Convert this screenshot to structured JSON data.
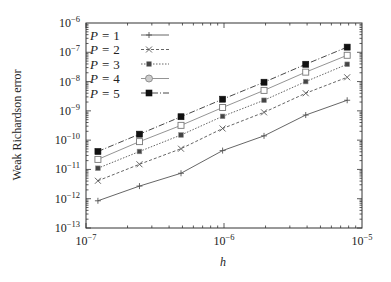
{
  "chart_data": {
    "type": "line",
    "title": "",
    "xlabel": "h",
    "ylabel": "Weak Richardson error",
    "xscale": "log",
    "yscale": "log",
    "xlim": [
      1e-07,
      1e-05
    ],
    "ylim": [
      1e-13,
      1e-06
    ],
    "grid": false,
    "legend_position": "upper left",
    "x_ticks": [
      {
        "base": "10",
        "exp": "−7",
        "value": 1e-07
      },
      {
        "base": "10",
        "exp": "−6",
        "value": 1e-06
      },
      {
        "base": "10",
        "exp": "−5",
        "value": 1e-05
      }
    ],
    "y_ticks": [
      {
        "base": "10",
        "exp": "−6",
        "value": 1e-06
      },
      {
        "base": "10",
        "exp": "−7",
        "value": 1e-07
      },
      {
        "base": "10",
        "exp": "−8",
        "value": 1e-08
      },
      {
        "base": "10",
        "exp": "−9",
        "value": 1e-09
      },
      {
        "base": "10",
        "exp": "−10",
        "value": 1e-10
      },
      {
        "base": "10",
        "exp": "−11",
        "value": 1e-11
      },
      {
        "base": "10",
        "exp": "−12",
        "value": 1e-12
      },
      {
        "base": "10",
        "exp": "−13",
        "value": 1e-13
      }
    ],
    "x": [
      1.22e-07,
      2.44e-07,
      4.88e-07,
      9.77e-07,
      1.95e-06,
      3.91e-06,
      7.81e-06
    ],
    "series": [
      {
        "name": "P = 1",
        "label_var": "P",
        "label_val": "1",
        "marker": "plus",
        "dash": "",
        "color": "#555555",
        "values": [
          8.5e-13,
          2.7e-12,
          7.4e-12,
          4.4e-11,
          1.4e-10,
          7.2e-10,
          2.3e-09
        ]
      },
      {
        "name": "P = 2",
        "label_var": "P",
        "label_val": "2",
        "marker": "cross",
        "dash": "3,2",
        "color": "#555555",
        "values": [
          4.1e-12,
          1.5e-11,
          5.1e-11,
          2.5e-10,
          8.9e-10,
          4e-09,
          1.4e-08
        ]
      },
      {
        "name": "P = 3",
        "label_var": "P",
        "label_val": "3",
        "marker": "star",
        "dash": "1.5,1.5",
        "color": "#555555",
        "values": [
          1.1e-11,
          4.1e-11,
          1.5e-10,
          6.5e-10,
          2.3e-09,
          1e-08,
          3.9e-08
        ]
      },
      {
        "name": "P = 4",
        "label_var": "P",
        "label_val": "4",
        "marker": "open-square",
        "dash": "",
        "color": "#888888",
        "values": [
          2.2e-11,
          8.9e-11,
          3.2e-10,
          1.3e-09,
          5e-09,
          2.1e-08,
          7.9e-08
        ]
      },
      {
        "name": "P = 5",
        "label_var": "P",
        "label_val": "5",
        "marker": "filled-square",
        "dash": "6,2,1,2",
        "color": "#333333",
        "values": [
          4.1e-11,
          1.6e-10,
          6.3e-10,
          2.5e-09,
          9.5e-09,
          3.9e-08,
          1.5e-07
        ]
      }
    ],
    "legend_marker_icons": [
      "plus-icon",
      "cross-icon",
      "star-icon",
      "open-circle-icon",
      "filled-square-icon"
    ]
  },
  "layout": {
    "plot": {
      "left": 86,
      "top": 23,
      "right": 362,
      "bottom": 228
    },
    "frame_color": "#333333"
  }
}
